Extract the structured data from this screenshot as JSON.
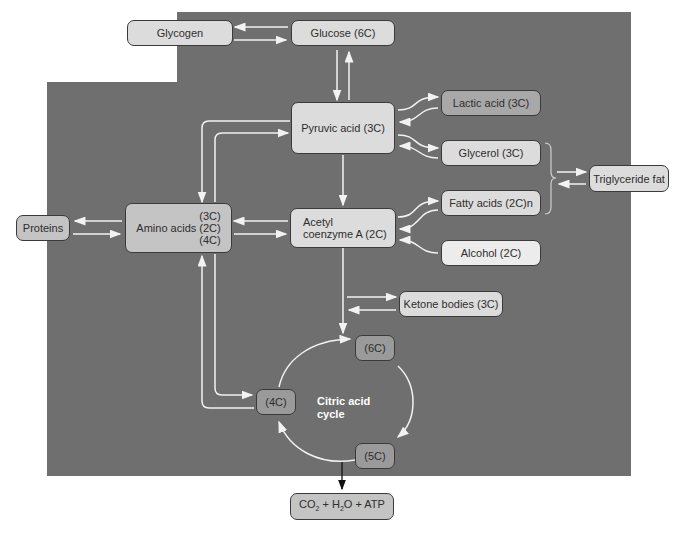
{
  "diagram": {
    "colors": {
      "background_panel": "#6f6f6f",
      "arrow": "#f2f2f2",
      "node_border": "#3a3a3a",
      "text": "#2e2e2e"
    },
    "nodes": {
      "glycogen": "Glycogen",
      "glucose": "Glucose (6C)",
      "pyruvic_acid": "Pyruvic acid (3C)",
      "lactic_acid": "Lactic acid (3C)",
      "glycerol": "Glycerol (3C)",
      "triglyceride_fat": "Triglyceride fat",
      "fatty_acids": "Fatty acids (2C)n",
      "alcohol": "Alcohol (2C)",
      "proteins": "Proteins",
      "amino_acids": {
        "label": "Amino acids",
        "carbons": [
          "(3C)",
          "(2C)",
          "(4C)"
        ]
      },
      "acetyl_coa": {
        "line1": "Acetyl",
        "line2": "coenzyme A (2C)"
      },
      "ketone_bodies": "Ketone bodies (3C)",
      "cycle_6c": "(6C)",
      "cycle_5c": "(5C)",
      "cycle_4c": "(4C)",
      "products": {
        "co": "CO",
        "co_sub": "2",
        "plus1": " + H",
        "h_sub": "2",
        "rest": "O + ATP"
      }
    },
    "cycle_label": {
      "line1": "Citric acid",
      "line2": "cycle"
    }
  }
}
